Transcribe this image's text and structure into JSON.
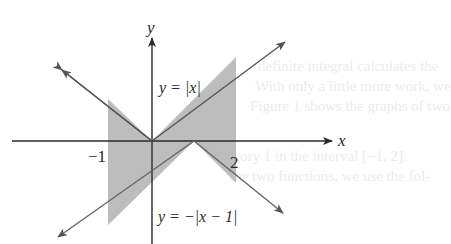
{
  "figure": {
    "background_text": [
      "definite integral calculates the",
      "With only a little more work, we",
      "Figure 1 shows the graphs of two",
      "ory 1 in the interval [−1, 2].",
      "the two functions, we use the fol-"
    ],
    "axes": {
      "x_label": "x",
      "y_label": "y",
      "tick_labels": [
        {
          "value": -1,
          "label": "−1"
        },
        {
          "value": 2,
          "label": "2"
        }
      ]
    },
    "curves": [
      {
        "name": "upper",
        "label": "y = |x|",
        "equation": "y=|x|"
      },
      {
        "name": "lower",
        "label": "y = −|x − 1|",
        "equation": "y=-|x-1|"
      }
    ],
    "shaded_region": {
      "x_from": -1,
      "x_to": 2,
      "fill": "#bdbdbd"
    },
    "colors": {
      "axis": "#2b2b2b",
      "curve": "#555555",
      "shade": "#bdbdbd"
    }
  }
}
